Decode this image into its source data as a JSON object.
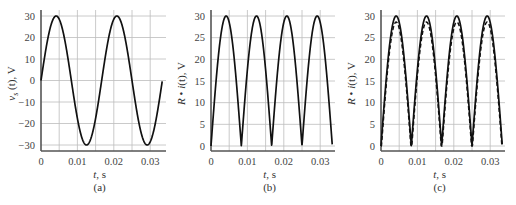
{
  "chart_data": [
    {
      "id": "a",
      "type": "line",
      "caption": "(a)",
      "xlabel": "t, s",
      "ylabel": "v_s (t), V",
      "ylabel_main": "v",
      "ylabel_sub": "s",
      "ylabel_rest": " (t), V",
      "xlim": [
        0,
        0.035
      ],
      "ylim": [
        -32,
        31
      ],
      "xticks": [
        0,
        0.01,
        0.02,
        0.03
      ],
      "xtick_labels": [
        "0",
        "0.01",
        "0.02",
        "0.03"
      ],
      "yticks": [
        30,
        20,
        10,
        0,
        -10,
        -20,
        -30
      ],
      "ytick_labels": [
        "30",
        "20",
        "10",
        "0",
        "−10",
        "−20",
        "−30"
      ],
      "grid": true,
      "series": [
        {
          "name": "v_s(t) = 30 sin(2π·60·t)",
          "style": "solid",
          "function": "sine",
          "amplitude": 30,
          "frequency_hz": 60,
          "t_end": 0.0333
        }
      ]
    },
    {
      "id": "b",
      "type": "line",
      "caption": "(b)",
      "xlabel": "t, s",
      "ylabel": "R • i(t), V",
      "xlim": [
        0,
        0.035
      ],
      "ylim": [
        -1,
        30.5
      ],
      "xticks": [
        0,
        0.01,
        0.02,
        0.03
      ],
      "xtick_labels": [
        "0",
        "0.01",
        "0.02",
        "0.03"
      ],
      "yticks": [
        30,
        25,
        20,
        15,
        10,
        5,
        0
      ],
      "ytick_labels": [
        "30",
        "25",
        "20",
        "15",
        "10",
        "5",
        "0"
      ],
      "grid": true,
      "series": [
        {
          "name": "R·i(t) = |30 sin(2π·60·t)|",
          "style": "solid",
          "function": "abs_sine",
          "amplitude": 30,
          "frequency_hz": 60,
          "t_end": 0.0333
        }
      ]
    },
    {
      "id": "c",
      "type": "line",
      "caption": "(c)",
      "xlabel": "t, s",
      "ylabel": "R • i(t), V",
      "xlim": [
        0,
        0.035
      ],
      "ylim": [
        -1,
        30.5
      ],
      "xticks": [
        0,
        0.01,
        0.02,
        0.03
      ],
      "xtick_labels": [
        "0",
        "0.01",
        "0.02",
        "0.03"
      ],
      "yticks": [
        30,
        25,
        20,
        15,
        10,
        5,
        0
      ],
      "ytick_labels": [
        "30",
        "25",
        "20",
        "15",
        "10",
        "5",
        "0"
      ],
      "grid": true,
      "series": [
        {
          "name": "ideal diodes",
          "style": "solid",
          "function": "abs_sine",
          "amplitude": 30,
          "frequency_hz": 60,
          "t_end": 0.0333
        },
        {
          "name": "with diode drop",
          "style": "dashed",
          "function": "abs_sine_offset",
          "amplitude": 30,
          "offset": 1.4,
          "frequency_hz": 60,
          "t_end": 0.0333
        }
      ]
    }
  ]
}
